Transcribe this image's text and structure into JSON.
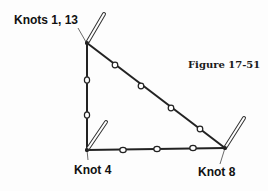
{
  "figure": {
    "caption": "Figure 17-51"
  },
  "labels": {
    "top_knot": "Knots 1, 13",
    "bottom_left_knot": "Knot 4",
    "bottom_right_knot": "Knot 8"
  },
  "diagram": {
    "type": "lashing-triangle",
    "colors": {
      "line": "#222222",
      "stick_outline": "#333333",
      "stick_fill": "#ffffff",
      "bead_fill": "#ffffff"
    },
    "vertices": {
      "top": [
        87,
        43
      ],
      "bottom_left": [
        87,
        150
      ],
      "bottom_right": [
        225,
        148
      ]
    },
    "sticks": [
      {
        "from": [
          87,
          43
        ],
        "to": [
          104,
          14
        ]
      },
      {
        "from": [
          87,
          150
        ],
        "to": [
          106,
          122
        ]
      },
      {
        "from": [
          225,
          148
        ],
        "to": [
          244,
          118
        ]
      }
    ],
    "beads": [
      [
        87,
        80
      ],
      [
        87,
        115
      ],
      [
        123,
        150
      ],
      [
        157,
        149
      ],
      [
        193,
        148
      ],
      [
        115,
        65
      ],
      [
        141,
        86
      ],
      [
        171,
        108
      ],
      [
        200,
        129
      ]
    ]
  }
}
